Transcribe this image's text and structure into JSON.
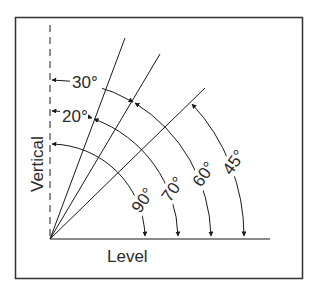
{
  "diagram": {
    "axes": {
      "vertical_label": "Vertical",
      "level_label": "Level"
    },
    "angles": [
      {
        "id": "90",
        "label": "90°",
        "radius": 95
      },
      {
        "id": "70",
        "label": "70°",
        "radius": 128
      },
      {
        "id": "60",
        "label": "60°",
        "radius": 161
      },
      {
        "id": "45",
        "label": "45°",
        "radius": 194
      }
    ],
    "offsets_from_vertical": [
      {
        "id": "20",
        "label": "20°"
      },
      {
        "id": "30",
        "label": "30°"
      }
    ],
    "colors": {
      "stroke": "#1a1a1a",
      "frame": "#333333",
      "text": "#2a2a2a",
      "background": "#ffffff"
    }
  }
}
